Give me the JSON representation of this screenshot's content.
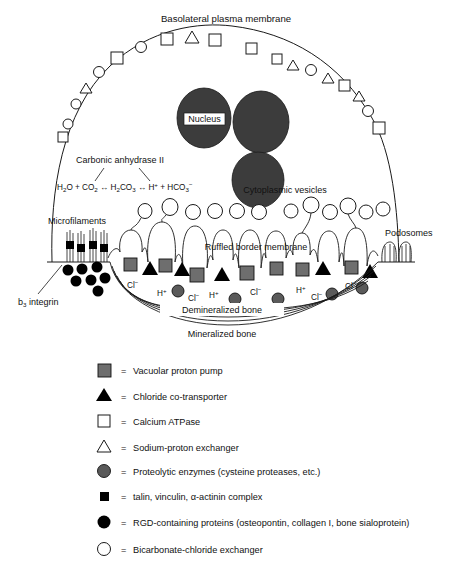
{
  "figure": {
    "title_top": "Basolateral plasma membrane",
    "nucleus_label": "Nucleus",
    "enzyme_label": "Carbonic anhydrase II",
    "equation": {
      "full": "H2O + CO2 ↔ H2CO3 ↔ H+ + HCO3-",
      "parts": [
        {
          "text": "H",
          "kind": "normal"
        },
        {
          "text": "2",
          "kind": "sub"
        },
        {
          "text": "O + CO",
          "kind": "normal"
        },
        {
          "text": "2",
          "kind": "sub"
        },
        {
          "text": "↔",
          "kind": "normal"
        },
        {
          "text": "H",
          "kind": "normal"
        },
        {
          "text": "2",
          "kind": "sub"
        },
        {
          "text": "CO",
          "kind": "normal"
        },
        {
          "text": "3",
          "kind": "sub"
        },
        {
          "text": "↔",
          "kind": "normal"
        },
        {
          "text": "H",
          "kind": "normal"
        },
        {
          "text": "+",
          "kind": "sup"
        },
        {
          "text": " + HCO",
          "kind": "normal"
        },
        {
          "text": "3",
          "kind": "sub"
        },
        {
          "text": "−",
          "kind": "sup"
        }
      ]
    },
    "vesicles_label": "Cytoplasmic vesicles",
    "microfilaments_label": "Microfilaments",
    "podosomes_label": "Podosomes",
    "integrin_label_main": "b",
    "integrin_label_sub": "3",
    "integrin_label_rest": " integrin",
    "ruffled_label": "Ruffled border membrane",
    "demineralized_label": "Demineralized bone",
    "mineralized_label": "Mineralized bone",
    "ion_labels": [
      {
        "ion": "Cl",
        "charge": "−",
        "x": 132,
        "y": 284
      },
      {
        "ion": "H",
        "charge": "+",
        "x": 160,
        "y": 291
      },
      {
        "ion": "Cl",
        "charge": "−",
        "x": 190,
        "y": 296
      },
      {
        "ion": "H",
        "charge": "+",
        "x": 212,
        "y": 291
      },
      {
        "ion": "Cl",
        "charge": "−",
        "x": 245,
        "y": 292
      },
      {
        "ion": "H",
        "charge": "+",
        "x": 295,
        "y": 288
      },
      {
        "ion": "Cl",
        "charge": "−",
        "x": 313,
        "y": 294
      },
      {
        "ion": "Cl",
        "charge": "−",
        "x": 348,
        "y": 285
      }
    ],
    "membrane_markers_left": [
      {
        "type": "square",
        "x": 63,
        "y": 137
      },
      {
        "type": "circle",
        "x": 68,
        "y": 124
      },
      {
        "type": "circle",
        "x": 76,
        "y": 104
      },
      {
        "type": "triangle",
        "x": 86,
        "y": 88
      },
      {
        "type": "circle",
        "x": 98,
        "y": 72
      },
      {
        "type": "square",
        "x": 117,
        "y": 58
      },
      {
        "type": "circle",
        "x": 141,
        "y": 48
      },
      {
        "type": "square",
        "x": 167,
        "y": 40
      }
    ],
    "membrane_markers_apex": [
      {
        "type": "triangle",
        "x": 192,
        "y": 37
      },
      {
        "type": "square",
        "x": 215,
        "y": 39
      }
    ],
    "membrane_markers_right": [
      {
        "type": "square",
        "x": 252,
        "y": 48
      },
      {
        "type": "square",
        "x": 277,
        "y": 58
      },
      {
        "type": "triangle",
        "x": 293,
        "y": 65
      },
      {
        "type": "circle",
        "x": 310,
        "y": 70
      },
      {
        "type": "triangle",
        "x": 328,
        "y": 78
      },
      {
        "type": "square",
        "x": 344,
        "y": 85
      },
      {
        "type": "triangle",
        "x": 358,
        "y": 96
      },
      {
        "type": "circle",
        "x": 367,
        "y": 110
      },
      {
        "type": "square",
        "x": 378,
        "y": 127
      }
    ],
    "colors": {
      "nucleus_fill": "#3c3c3c",
      "pump_fill": "#6e6e6e",
      "enzyme_fill": "#5a5a5a",
      "line": "#1a1a1a",
      "background": "#ffffff"
    }
  },
  "legend": {
    "items": [
      {
        "icon": "filled-gray-square",
        "eq": "=",
        "label": "Vacuolar proton pump"
      },
      {
        "icon": "filled-black-triangle",
        "eq": "=",
        "label": "Chloride co-transporter"
      },
      {
        "icon": "open-square",
        "eq": "=",
        "label": "Calcium ATPase"
      },
      {
        "icon": "open-triangle",
        "eq": "=",
        "label": "Sodium-proton exchanger"
      },
      {
        "icon": "filled-gray-circle",
        "eq": "=",
        "label": "Proteolytic enzymes (cysteine proteases, etc.)"
      },
      {
        "icon": "small-black-square",
        "eq": "=",
        "label": "talin, vinculin, α-actinin complex"
      },
      {
        "icon": "filled-black-circle",
        "eq": "=",
        "label": "RGD-containing proteins (osteopontin, collagen I, bone sialoprotein)"
      },
      {
        "icon": "open-circle",
        "eq": "=",
        "label": "Bicarbonate-chloride exchanger"
      }
    ]
  }
}
